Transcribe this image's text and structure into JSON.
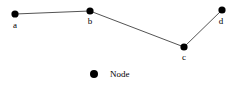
{
  "figure": {
    "background_color": "#ffffff",
    "width": 241,
    "height": 88
  },
  "chart_data": {
    "type": "scatter",
    "title": "",
    "xlabel": "",
    "ylabel": "",
    "grid": false,
    "legend_position": "bottom-center",
    "node_color": "#000000",
    "edge_color": "#404040",
    "node_radius": 3.6,
    "edge_width": 0.9,
    "nodes": [
      {
        "id": "a",
        "label": "a",
        "x": 15,
        "y": 14,
        "label_x": 15,
        "label_y": 21
      },
      {
        "id": "b",
        "label": "b",
        "x": 90,
        "y": 11,
        "label_x": 90,
        "label_y": 17
      },
      {
        "id": "c",
        "label": "c",
        "x": 184,
        "y": 47,
        "label_x": 184,
        "label_y": 53
      },
      {
        "id": "d",
        "label": "d",
        "x": 222,
        "y": 10,
        "label_x": 221,
        "label_y": 17
      }
    ],
    "edges": [
      {
        "source": "a",
        "target": "b"
      },
      {
        "source": "b",
        "target": "c"
      },
      {
        "source": "c",
        "target": "d"
      }
    ],
    "legend": [
      {
        "marker": "circle",
        "color": "#000000",
        "label": "Node"
      }
    ]
  }
}
